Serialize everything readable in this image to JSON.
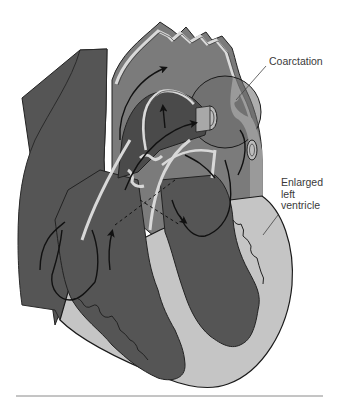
{
  "figure": {
    "labels": {
      "coarctation": "Coarctation",
      "enlarged_lv": [
        "Enlarged",
        "left",
        "ventricle"
      ]
    },
    "colors": {
      "dark_chamber": "#545454",
      "mid_vessel": "#7a7a7a",
      "light_wall": "#c4c4c4",
      "outline": "#1e1e1e",
      "highlight": "#dcdcdc",
      "rule": "#888888"
    }
  }
}
